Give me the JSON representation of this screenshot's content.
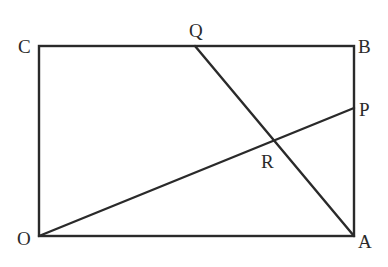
{
  "diagram": {
    "stroke_color": "#2a2a2a",
    "points": {
      "O": {
        "label": "O",
        "x": 39,
        "y": 236
      },
      "A": {
        "label": "A",
        "x": 354,
        "y": 236
      },
      "B": {
        "label": "B",
        "x": 354,
        "y": 46
      },
      "C": {
        "label": "C",
        "x": 39,
        "y": 46
      },
      "P": {
        "label": "P",
        "x": 354,
        "y": 108
      },
      "Q": {
        "label": "Q",
        "x": 195,
        "y": 46
      },
      "R": {
        "label": "R",
        "x": 273,
        "y": 141
      }
    },
    "segments": [
      [
        "O",
        "A"
      ],
      [
        "A",
        "B"
      ],
      [
        "B",
        "C"
      ],
      [
        "C",
        "O"
      ],
      [
        "O",
        "P"
      ],
      [
        "Q",
        "A"
      ]
    ]
  }
}
